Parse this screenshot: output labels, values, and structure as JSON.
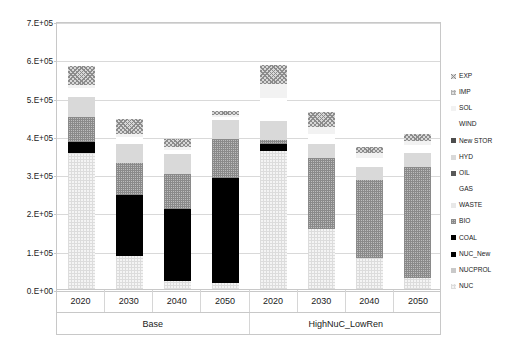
{
  "chart_data": {
    "type": "bar",
    "stacked": true,
    "title": "",
    "xlabel": "",
    "ylabel": "production (GWh)",
    "ylim": [
      0,
      700000
    ],
    "ytick_labels": [
      "0.E+00",
      "1.E+05",
      "2.E+05",
      "3.E+05",
      "4.E+05",
      "5.E+05",
      "6.E+05",
      "7.E+05"
    ],
    "ytick_values": [
      0,
      100000,
      200000,
      300000,
      400000,
      500000,
      600000,
      700000
    ],
    "grid": true,
    "legend_position": "right",
    "groups": [
      "Base",
      "HighNuC_LowRen"
    ],
    "categories": [
      "2020",
      "2030",
      "2040",
      "2050",
      "2020",
      "2030",
      "2040",
      "2050"
    ],
    "group_of_category": [
      "Base",
      "Base",
      "Base",
      "Base",
      "HighNuC_LowRen",
      "HighNuC_LowRen",
      "HighNuC_LowRen",
      "HighNuC_LowRen"
    ],
    "series_order_bottom_to_top": [
      "NUC",
      "NUCPROL",
      "NUC_New",
      "COAL",
      "BIO",
      "WASTE",
      "GAS",
      "OIL",
      "HYD",
      "New STOR",
      "WIND",
      "SOL",
      "IMP",
      "EXP"
    ],
    "series": [
      {
        "name": "NUC",
        "values": [
          355000,
          85000,
          22000,
          16000,
          360000,
          158000,
          82000,
          30000
        ]
      },
      {
        "name": "NUCPROL",
        "values": [
          0,
          0,
          0,
          0,
          0,
          0,
          0,
          0
        ]
      },
      {
        "name": "NUC_New",
        "values": [
          30000,
          160000,
          188000,
          275000,
          18000,
          0,
          0,
          0
        ]
      },
      {
        "name": "COAL",
        "values": [
          0,
          0,
          0,
          0,
          0,
          0,
          0,
          0
        ]
      },
      {
        "name": "BIO",
        "values": [
          65000,
          85000,
          90000,
          100000,
          12000,
          183000,
          203000,
          290000
        ]
      },
      {
        "name": "WASTE",
        "values": [
          0,
          0,
          0,
          0,
          0,
          0,
          0,
          0
        ]
      },
      {
        "name": "GAS",
        "values": [
          0,
          0,
          0,
          0,
          0,
          0,
          0,
          0
        ]
      },
      {
        "name": "OIL",
        "values": [
          0,
          0,
          0,
          0,
          0,
          0,
          0,
          0
        ]
      },
      {
        "name": "HYD",
        "values": [
          52000,
          50000,
          52000,
          50000,
          48000,
          37000,
          35000,
          35000
        ]
      },
      {
        "name": "New STOR",
        "values": [
          0,
          0,
          0,
          0,
          0,
          0,
          0,
          0
        ]
      },
      {
        "name": "WIND",
        "values": [
          22000,
          18000,
          12000,
          8000,
          62000,
          27000,
          22000,
          22000
        ]
      },
      {
        "name": "SOL",
        "values": [
          10000,
          8000,
          6000,
          5000,
          35000,
          17000,
          12000,
          10000
        ]
      },
      {
        "name": "IMP",
        "values": [
          0,
          0,
          0,
          0,
          0,
          0,
          0,
          0
        ]
      },
      {
        "name": "EXP",
        "values": [
          48000,
          37000,
          22000,
          12000,
          50000,
          40000,
          18000,
          18000
        ]
      }
    ],
    "totals": [
      582000,
      443000,
      392000,
      466000,
      585000,
      462000,
      372000,
      405000
    ],
    "bar_tops": [
      625000,
      600000,
      580000,
      570000,
      620000,
      590000,
      578000,
      588000
    ]
  },
  "axes": {
    "y_title": "production (GWh)",
    "y_ticks": [
      "7.E+05",
      "6.E+05",
      "5.E+05",
      "4.E+05",
      "3.E+05",
      "2.E+05",
      "1.E+05",
      "0.E+00"
    ],
    "x_ticks": [
      "2020",
      "2030",
      "2040",
      "2050",
      "2020",
      "2030",
      "2040",
      "2050"
    ],
    "x_groups": [
      "Base",
      "HighNuC_LowRen"
    ]
  },
  "legend": {
    "items": [
      {
        "label": "EXP",
        "fill": "#8c8c8c",
        "pattern": "diagonal-cross"
      },
      {
        "label": "IMP",
        "fill": "#b0b0b0",
        "pattern": "dots"
      },
      {
        "label": "SOL",
        "fill": "#f2f2f2",
        "pattern": "solid"
      },
      {
        "label": "WIND",
        "fill": "#ffffff",
        "pattern": "solid"
      },
      {
        "label": "New STOR",
        "fill": "#4d4d4d",
        "pattern": "solid"
      },
      {
        "label": "HYD",
        "fill": "#d9d9d9",
        "pattern": "solid"
      },
      {
        "label": "OIL",
        "fill": "#595959",
        "pattern": "solid"
      },
      {
        "label": "GAS",
        "fill": "#ffffff",
        "pattern": "solid"
      },
      {
        "label": "WASTE",
        "fill": "#e8e8e8",
        "pattern": "solid"
      },
      {
        "label": "BIO",
        "fill": "#8a8a8a",
        "pattern": "checker"
      },
      {
        "label": "COAL",
        "fill": "#000000",
        "pattern": "solid"
      },
      {
        "label": "NUC_New",
        "fill": "#000000",
        "pattern": "solid"
      },
      {
        "label": "NUCPROL",
        "fill": "#c9c9c9",
        "pattern": "solid"
      },
      {
        "label": "NUC",
        "fill": "#ededed",
        "pattern": "fine-dots"
      }
    ]
  },
  "colors": {
    "grid": "#d9d9d9",
    "frame": "#c8c8c8",
    "text": "#1a1a1a",
    "background": "#ffffff"
  }
}
